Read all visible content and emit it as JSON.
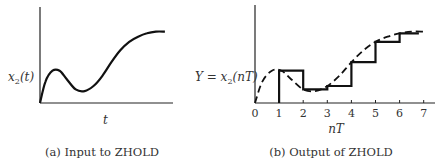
{
  "chart_data": [
    {
      "type": "line",
      "title": "",
      "caption": "(a) Input to ZHOLD",
      "xlabel": "t",
      "ylabel": "x₂(t)",
      "ylabel_main": "x",
      "ylabel_sub": "2",
      "ylabel_tail": "(t)",
      "xlim": [
        0,
        7.4
      ],
      "ylim": [
        0,
        1.0
      ],
      "series": [
        {
          "name": "x2(t)",
          "style": "solid",
          "x": [
            0,
            0.3,
            0.7,
            1.1,
            1.5,
            2.0,
            2.5,
            3.0,
            3.5,
            4.0,
            4.5,
            5.0,
            5.5,
            6.0,
            6.5,
            7.0
          ],
          "y": [
            0,
            0.25,
            0.38,
            0.38,
            0.28,
            0.16,
            0.14,
            0.2,
            0.32,
            0.48,
            0.62,
            0.72,
            0.78,
            0.82,
            0.84,
            0.84
          ]
        }
      ]
    },
    {
      "type": "line",
      "title": "",
      "caption": "(b) Output of ZHOLD",
      "xlabel": "nT",
      "ylabel": "Y = x₂(nT)",
      "ylabel_pre": "Y = x",
      "ylabel_sub": "2",
      "ylabel_tail": "(nT)",
      "xticks": [
        0,
        1,
        2,
        3,
        4,
        5,
        6,
        7
      ],
      "xtick_labels": [
        "0",
        "1",
        "2",
        "3",
        "4",
        "5",
        "6",
        "7"
      ],
      "xlim": [
        0,
        7.4
      ],
      "ylim": [
        0,
        1.0
      ],
      "series": [
        {
          "name": "continuous x2(t)",
          "style": "dashed",
          "x": [
            0,
            0.3,
            0.7,
            1.1,
            1.5,
            2.0,
            2.5,
            3.0,
            3.5,
            4.0,
            4.5,
            5.0,
            5.5,
            6.0,
            6.5,
            7.0
          ],
          "y": [
            0,
            0.25,
            0.38,
            0.38,
            0.28,
            0.16,
            0.14,
            0.2,
            0.32,
            0.48,
            0.62,
            0.72,
            0.78,
            0.82,
            0.84,
            0.84
          ]
        },
        {
          "name": "zero-order hold output",
          "style": "step",
          "x": [
            1,
            2,
            3,
            4,
            5,
            6,
            6.8
          ],
          "y": [
            0.38,
            0.16,
            0.2,
            0.48,
            0.72,
            0.82,
            0.84
          ]
        }
      ]
    }
  ]
}
